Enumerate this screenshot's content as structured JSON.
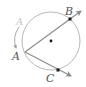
{
  "diagram": {
    "labels": {
      "vertex": "A",
      "vertex_ghost": "A",
      "point_b": "B",
      "point_c": "C"
    },
    "colors": {
      "circle": "#b8b8b8",
      "ray": "#8a8a8a",
      "point": "#1a1a1a",
      "arc_arrow": "#a0a0a0"
    }
  }
}
